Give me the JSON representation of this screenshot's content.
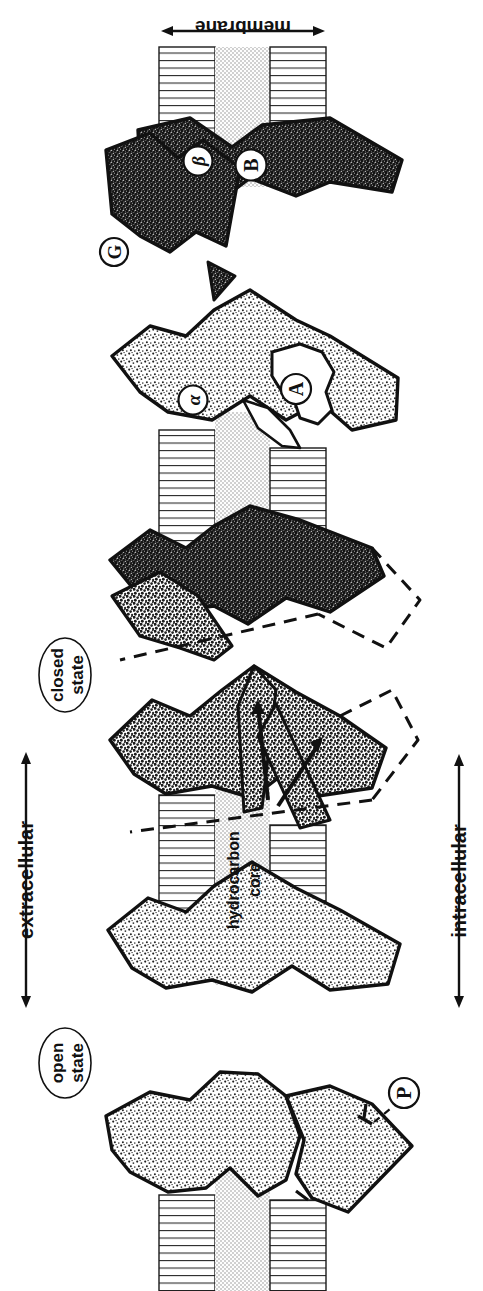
{
  "figure": {
    "type": "scientific-diagram",
    "orientation_note": "whole figure rotated 90 degrees",
    "background_color": "#ffffff",
    "ink_color": "#111111"
  },
  "axis_labels": {
    "membrane": "membrane",
    "extracellular": "extracellular",
    "intracellular": "intracellular"
  },
  "membrane": {
    "core_label_line1": "hydrocarbon",
    "core_label_line2": "core",
    "headgroup_fill": "#ffffff",
    "core_fill": "#e3e3e3",
    "line_color": "#1a1a1a"
  },
  "states": [
    {
      "id": "open",
      "line1": "open",
      "line2": "state"
    },
    {
      "id": "closed",
      "line1": "closed",
      "line2": "state"
    }
  ],
  "callouts": [
    {
      "id": "P",
      "text": "P",
      "leader": "dashed"
    },
    {
      "id": "alpha",
      "text": "α",
      "leader": "none"
    },
    {
      "id": "A",
      "text": "A",
      "leader": "none"
    },
    {
      "id": "beta",
      "text": "β",
      "leader": "none"
    },
    {
      "id": "B",
      "text": "B",
      "leader": "none"
    },
    {
      "id": "G",
      "text": "G",
      "leader": "none"
    }
  ],
  "panels": [
    {
      "index": 1,
      "state": "open",
      "subunit_shade": "light",
      "dashed_outline": false
    },
    {
      "index": 2,
      "state": "open",
      "subunit_shade": "light",
      "dashed_outline": false
    },
    {
      "index": 3,
      "state": "closed",
      "subunit_shade": "medium",
      "dashed_outline": true
    },
    {
      "index": 4,
      "state": "closed",
      "subunit_shade": "dark",
      "dashed_outline": true
    },
    {
      "index": 5,
      "state": "closed",
      "subunit_shade": "light",
      "dashed_outline": false
    },
    {
      "index": 6,
      "state": "closed",
      "subunit_shade": "dark",
      "dashed_outline": false
    }
  ]
}
